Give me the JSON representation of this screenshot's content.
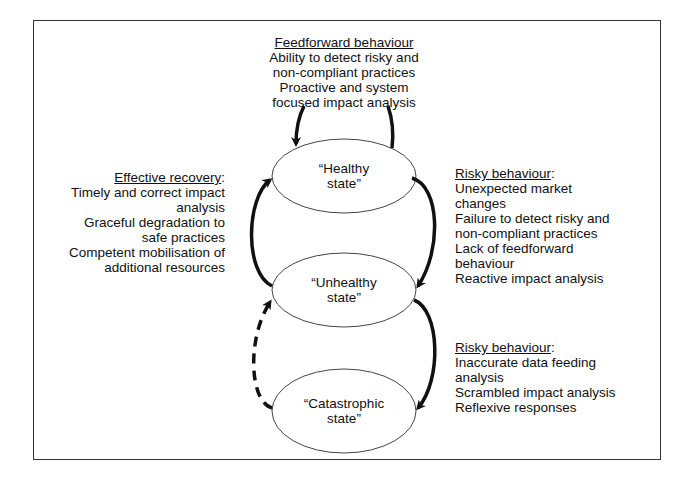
{
  "diagram": {
    "feedforward": {
      "heading": "Feedforward behaviour",
      "lines": [
        "Ability to detect risky and",
        "non-compliant practices",
        "Proactive and system",
        "focused impact analysis"
      ]
    },
    "effective_recovery": {
      "heading": "Effective recovery",
      "heading_suffix": ":",
      "lines": [
        "Timely and correct impact",
        "analysis",
        "Graceful degradation to",
        "safe practices",
        "Competent mobilisation of",
        "additional resources"
      ]
    },
    "risky_behaviour_1": {
      "heading": "Risky behaviour",
      "heading_suffix": ":",
      "lines": [
        "Unexpected market",
        "changes",
        "Failure to detect risky and",
        "non-compliant practices",
        "Lack of feedforward",
        "behaviour",
        "Reactive impact analysis"
      ]
    },
    "risky_behaviour_2": {
      "heading": "Risky behaviour",
      "heading_suffix": ":",
      "lines": [
        "Inaccurate data feeding",
        "analysis",
        "Scrambled impact analysis",
        "Reflexive responses"
      ]
    },
    "states": {
      "healthy": {
        "line1": "“Healthy",
        "line2": "state”"
      },
      "unhealthy": {
        "line1": "“Unhealthy",
        "line2": "state”"
      },
      "catastrophic": {
        "line1": "“Catastrophic",
        "line2": "state”"
      }
    },
    "arrows": [
      {
        "from": "healthy",
        "to": "healthy",
        "style": "solid",
        "label": "feedforward loop"
      },
      {
        "from": "healthy",
        "to": "unhealthy",
        "style": "solid",
        "label": "risky behaviour"
      },
      {
        "from": "unhealthy",
        "to": "healthy",
        "style": "solid",
        "label": "effective recovery"
      },
      {
        "from": "unhealthy",
        "to": "catastrophic",
        "style": "solid",
        "label": "risky behaviour"
      },
      {
        "from": "catastrophic",
        "to": "unhealthy",
        "style": "dashed",
        "label": "recovery"
      }
    ],
    "colors": {
      "stroke": "#111111",
      "background": "#ffffff",
      "frame": "#333333"
    }
  }
}
